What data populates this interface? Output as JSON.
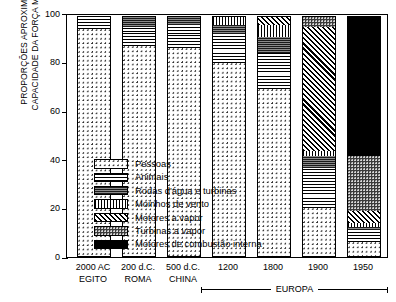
{
  "chart_data": {
    "type": "bar",
    "subtype": "stacked-100-percent",
    "title": "",
    "xlabel": "",
    "ylabel": "PROPORÇÕES APROXIMADAS DA CAPACIDADE DA FORÇA MOTRIZ (%)",
    "ylabel_lines": [
      "PROPORÇÕES APROXIMADAS DA",
      "CAPACIDADE DA FORÇA MOTRIZ (%)"
    ],
    "ylim": [
      0,
      100
    ],
    "yticks": [
      0,
      20,
      40,
      60,
      80,
      100
    ],
    "ytick_labels": [
      "0",
      "20",
      "40",
      "60",
      "80",
      "100"
    ],
    "grid": false,
    "legend_position": "inside-lower-left",
    "categories": [
      "2000 AC",
      "200 d.C.",
      "500 d.C.",
      "1200",
      "1800",
      "1900",
      "1950"
    ],
    "category_sublabels": [
      "EGITO",
      "ROMA",
      "CHINA",
      "",
      "",
      "",
      ""
    ],
    "group_annotation": "EUROPA",
    "group_annotation_covers": [
      "1200",
      "1800",
      "1900",
      "1950"
    ],
    "series": [
      {
        "name": "Pessoas",
        "pattern": "sparse-dots",
        "values": [
          95,
          88,
          87,
          81,
          70,
          20,
          6
        ]
      },
      {
        "name": "Animais",
        "pattern": "horizontal-lines",
        "values": [
          5,
          8,
          10,
          12,
          15,
          17,
          5
        ]
      },
      {
        "name": "Rodas d'água e turbinas",
        "pattern": "dark-gray-lines",
        "values": [
          0,
          4,
          3,
          4,
          7,
          5,
          1
        ]
      },
      {
        "name": "Moinhos de vento",
        "pattern": "vertical-lines",
        "values": [
          0,
          0,
          0,
          3,
          5,
          2,
          2
        ]
      },
      {
        "name": "Motores a vapor",
        "pattern": "diagonal-hatch",
        "values": [
          0,
          0,
          0,
          0,
          3,
          52,
          5
        ]
      },
      {
        "name": "Turbinas a vapor",
        "pattern": "dark-dots",
        "values": [
          0,
          0,
          0,
          0,
          0,
          4,
          23
        ]
      },
      {
        "name": "Motores de combustão interna",
        "pattern": "solid-black",
        "values": [
          0,
          0,
          0,
          0,
          0,
          0,
          58
        ]
      }
    ],
    "legend_entries": [
      "Pessoas",
      "Animais",
      "Rodas d'água e turbinas",
      "Moinhos de vento",
      "Motores a vapor",
      "Turbinas a vapor",
      "Motores de combustão interna"
    ],
    "colors": {
      "axis": "#000000",
      "background": "#ffffff",
      "ink": "#000000"
    }
  }
}
